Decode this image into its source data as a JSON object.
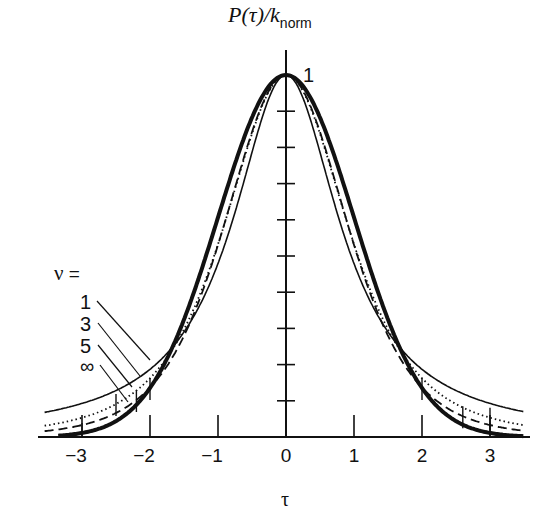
{
  "chart_data": {
    "type": "line",
    "title": "",
    "xlabel": "τ",
    "ylabel": "P(τ)/k_norm",
    "ylabel_parts": {
      "main": "P(τ)/k",
      "subscript": "norm"
    },
    "xlim": [
      -3.6,
      3.6
    ],
    "ylim": [
      0,
      1
    ],
    "x_ticks": [
      -3,
      -2,
      -1,
      0,
      1,
      2,
      3
    ],
    "x_tick_labels": [
      "−3",
      "−2",
      "−1",
      "0",
      "1",
      "2",
      "3"
    ],
    "y_ticks": [
      0.1,
      0.2,
      0.3,
      0.4,
      0.5,
      0.6,
      0.7,
      0.8,
      0.9
    ],
    "y_tick_labels": [],
    "annotations": [
      {
        "text": "1",
        "x": 0.3,
        "y": 1.0,
        "note": "peak value"
      }
    ],
    "grid": false,
    "legend": {
      "title": "ν =",
      "position": "left",
      "entries": [
        "1",
        "3",
        "5",
        "∞"
      ]
    },
    "x": [
      -3.5,
      -3.0,
      -2.5,
      -2.0,
      -1.5,
      -1.0,
      -0.5,
      0,
      0.5,
      1.0,
      1.5,
      2.0,
      2.5,
      3.0,
      3.5
    ],
    "series": [
      {
        "name": "1",
        "style": "thin-solid",
        "values": [
          0.07,
          0.093,
          0.128,
          0.187,
          0.29,
          0.479,
          0.786,
          1.0,
          0.786,
          0.479,
          0.29,
          0.187,
          0.128,
          0.093,
          0.07
        ]
      },
      {
        "name": "3",
        "style": "dotted",
        "values": [
          0.033,
          0.06,
          0.096,
          0.165,
          0.292,
          0.533,
          0.837,
          1.0,
          0.837,
          0.533,
          0.292,
          0.165,
          0.096,
          0.06,
          0.033
        ]
      },
      {
        "name": "5",
        "style": "dashed",
        "values": [
          0.027,
          0.048,
          0.087,
          0.164,
          0.31,
          0.562,
          0.853,
          1.0,
          0.853,
          0.562,
          0.31,
          0.164,
          0.087,
          0.048,
          0.027
        ]
      },
      {
        "name": "∞",
        "style": "thick-solid",
        "values": [
          0.002,
          0.011,
          0.044,
          0.135,
          0.325,
          0.607,
          0.882,
          1.0,
          0.882,
          0.607,
          0.325,
          0.135,
          0.044,
          0.011,
          0.002
        ]
      }
    ],
    "series_params": {
      "1": {
        "nu": 1,
        "s2": 0.92
      },
      "3": {
        "nu": 3,
        "s2": 0.9
      },
      "5": {
        "nu": 5,
        "s2": 0.85
      },
      "∞": {
        "nu": null,
        "s2": 1.0
      }
    },
    "quantile_markers": {
      "1": [],
      "3": [
        -2.5,
        3.0
      ],
      "5": [
        -2.2,
        2.6
      ],
      "∞": [
        -2.0,
        -3.0,
        2.0,
        3.0
      ]
    }
  },
  "labels": {
    "legend_title_nu": "ν",
    "legend_title_eq": " =",
    "peak": "1"
  }
}
